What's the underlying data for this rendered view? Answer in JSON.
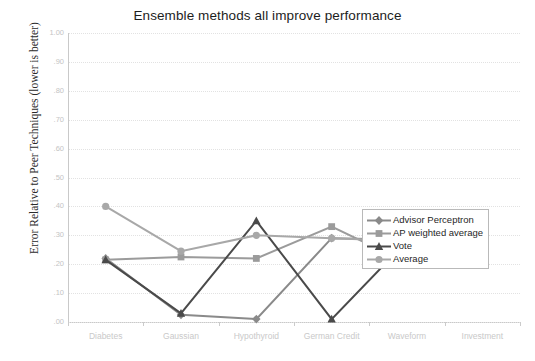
{
  "chart_data": {
    "type": "line",
    "title": "Ensemble methods all improve performance",
    "xlabel": "",
    "ylabel": "Error Relative to Peer Techniques (lower is better)",
    "categories": [
      "Diabetes",
      "Gaussian",
      "Hypothyroid",
      "German Credit",
      "Waveform",
      "Investment"
    ],
    "ylim": [
      0.0,
      1.0
    ],
    "ytick_labels": [
      "1.00",
      ".90",
      ".80",
      ".70",
      ".60",
      ".50",
      ".40",
      ".30",
      ".20",
      ".10",
      ".00"
    ],
    "ytick_values": [
      1.0,
      0.9,
      0.8,
      0.7,
      0.6,
      0.5,
      0.4,
      0.3,
      0.2,
      0.1,
      0.0
    ],
    "grid": true,
    "legend_position": "center-right",
    "series": [
      {
        "name": "Advisor Perceptron",
        "marker": "diamond",
        "color": "#8a8a8a",
        "values": [
          0.22,
          0.025,
          0.01,
          0.29,
          0.285,
          0.215
        ]
      },
      {
        "name": "AP weighted average",
        "marker": "square",
        "color": "#9b9b9b",
        "values": [
          0.215,
          0.225,
          0.22,
          0.33,
          0.205,
          0.215
        ]
      },
      {
        "name": "Vote",
        "marker": "triangle",
        "color": "#4a4a4a",
        "values": [
          0.215,
          0.03,
          0.35,
          0.01,
          0.28,
          0.21
        ]
      },
      {
        "name": "Average",
        "marker": "circle",
        "color": "#a8a8a8",
        "values": [
          0.4,
          0.245,
          0.3,
          0.29,
          0.28,
          0.265
        ]
      }
    ]
  },
  "colors": {
    "axis": "#c9c9c9",
    "grid": "#e2e2e2",
    "tick_text": "#c4c4c4",
    "title_text": "#1d1d1d"
  }
}
